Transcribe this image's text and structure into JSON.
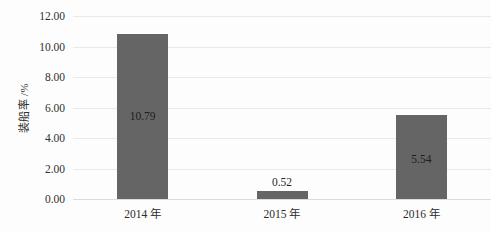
{
  "chart_data": {
    "type": "bar",
    "title": "",
    "subtitle": "",
    "xlabel": "",
    "ylabel": "装船率 /%",
    "categories": [
      "2014 年",
      "2015 年",
      "2016 年"
    ],
    "values": [
      10.79,
      0.52,
      5.54
    ],
    "data_labels": [
      "10.79",
      "0.52",
      "5.54"
    ],
    "series": [
      {
        "name": "装船率",
        "values": [
          10.79,
          0.52,
          5.54
        ]
      }
    ],
    "ylim": [
      0,
      12
    ],
    "ytick_step": 2,
    "ytick_labels": [
      "0.00",
      "2.00",
      "4.00",
      "6.00",
      "8.00",
      "10.00",
      "12.00"
    ],
    "ytick_values": [
      0,
      2,
      4,
      6,
      8,
      10,
      12
    ],
    "grid": true,
    "grid_axis": "y",
    "legend": false,
    "legend_position": "none",
    "bar_color": "#656565",
    "gridline_color": "#e9e9ea",
    "background_color": "#fdfdfd",
    "label_placement": [
      "inside",
      "above",
      "inside"
    ]
  }
}
